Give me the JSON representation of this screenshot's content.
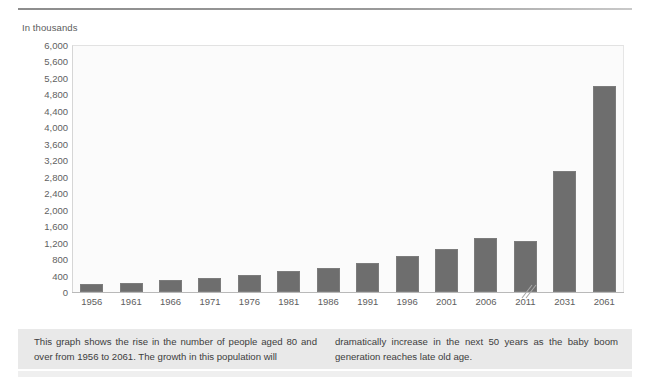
{
  "figure": {
    "axis_unit_label": "In thousands",
    "bar_color": "#6e6e6e",
    "plot_background": "#fbfbfb"
  },
  "chart_data": {
    "type": "bar",
    "title": "",
    "subtitle": "",
    "xlabel": "",
    "ylabel": "In thousands",
    "ylim": [
      0,
      6000
    ],
    "ytick_step": 400,
    "ytick_labels": [
      "6,000",
      "5,600",
      "5,200",
      "4,800",
      "4,400",
      "4,000",
      "3,600",
      "3,200",
      "2,800",
      "2,400",
      "2,000",
      "1,600",
      "1,200",
      "800",
      "400",
      "0"
    ],
    "ytick_values": [
      6000,
      5600,
      5200,
      4800,
      4400,
      4000,
      3600,
      3200,
      2800,
      2400,
      2000,
      1600,
      1200,
      800,
      400,
      0
    ],
    "grid": false,
    "legend": null,
    "categories": [
      "1956",
      "1961",
      "1966",
      "1971",
      "1976",
      "1981",
      "1986",
      "1991",
      "1996",
      "2001",
      "2006",
      "2011",
      "2031",
      "2061"
    ],
    "values": [
      200,
      230,
      280,
      340,
      420,
      500,
      580,
      700,
      870,
      1040,
      1320,
      1250,
      2950,
      5000
    ],
    "series": [
      {
        "name": "People aged 80 and over",
        "values": [
          200,
          230,
          280,
          340,
          420,
          500,
          580,
          700,
          870,
          1040,
          1320,
          1250,
          2950,
          5000
        ]
      }
    ]
  },
  "caption": {
    "column_left": "This graph shows the rise in the number of people aged 80 and over from 1956 to 2061. The growth in this population will",
    "column_right": "dramatically increase in the next 50 years as the baby boom generation reaches late old age."
  }
}
